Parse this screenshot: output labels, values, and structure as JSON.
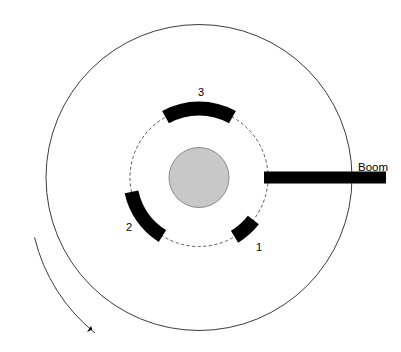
{
  "diagram": {
    "background_color": "#ffffff",
    "line_color": "#3c3c3c",
    "segment_color": "#000000",
    "hub_fill_color": "#c8c8c8",
    "hub_stroke_color": "#8c8c8c",
    "center": {
      "x": 199,
      "y": 177.5
    },
    "outer_circle": {
      "name": "outer-circle",
      "radius": 153,
      "dashed": false
    },
    "inner_circle": {
      "name": "inner-dashed-circle",
      "radius": 69,
      "dashed": true
    },
    "hub": {
      "name": "hub",
      "radius": 30
    },
    "boom": {
      "label": "Boom",
      "label_x": 358,
      "label_y": 168,
      "bar": {
        "x_start": 264,
        "x_end": 386,
        "y_top": 171.5,
        "y_bottom": 183.5,
        "thickness": 12
      }
    },
    "rotation_arrow": {
      "name": "rotation-direction-arrow",
      "radius": 175,
      "start_angle_deg": 160,
      "end_angle_deg": 108,
      "arrowhead_x": 95,
      "arrowhead_y": 333
    },
    "segments": [
      {
        "label": "1",
        "name": "blade-segment-1",
        "start_angle_deg": 38,
        "end_angle_deg": 59,
        "inner_radius": 62,
        "outer_radius": 76,
        "label_x": 259,
        "label_y": 248
      },
      {
        "label": "2",
        "name": "blade-segment-2",
        "start_angle_deg": 122,
        "end_angle_deg": 168,
        "inner_radius": 62,
        "outer_radius": 76,
        "label_x": 129,
        "label_y": 228
      },
      {
        "label": "3",
        "name": "blade-segment-3",
        "start_angle_deg": 241,
        "end_angle_deg": 299,
        "inner_radius": 62,
        "outer_radius": 76,
        "label_x": 201,
        "label_y": 93
      }
    ]
  }
}
